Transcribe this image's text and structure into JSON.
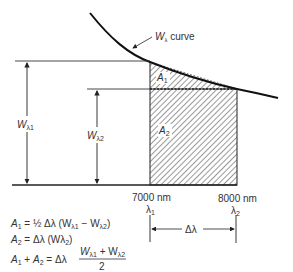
{
  "diagram": {
    "curve_label": "W",
    "curve_label_sub": "λ",
    "curve_label_suffix": " curve",
    "w1_label": "W",
    "w1_sub": "λ1",
    "w2_label": "W",
    "w2_sub": "λ2",
    "area1_label": "A",
    "area1_sub": "1",
    "area2_label": "A",
    "area2_sub": "2",
    "x1_value": "7000 nm",
    "x2_value": "8000 nm",
    "lambda1": "λ",
    "lambda1_sub": "1",
    "lambda2": "λ",
    "lambda2_sub": "2",
    "delta_lambda": "Δλ"
  },
  "equations": [
    {
      "lhs": "A",
      "lhs_sub": "1",
      "rhs": " = ½ Δλ (W",
      "rhs_sub1": "λ1",
      "rhs_mid": " − W",
      "rhs_sub2": "λ2",
      "rhs_end": ")"
    },
    {
      "lhs": "A",
      "lhs_sub": "2",
      "rhs": " = Δλ (Wλ",
      "rhs_sub1": "2",
      "rhs_end": ")"
    },
    {
      "lhs_a": "A",
      "lhs_a_sub": "1",
      "plus": " + ",
      "lhs_b": "A",
      "lhs_b_sub": "2",
      "eq": " = Δλ",
      "num": "W",
      "num_sub1": "λ1",
      "num_plus": " + W",
      "num_sub2": "λ2",
      "den": "2"
    }
  ],
  "colors": {
    "ink": "#1a1a1a",
    "hatch": "#444444",
    "text": "#333333"
  }
}
